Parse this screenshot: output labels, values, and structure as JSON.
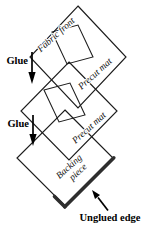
{
  "diagram": {
    "type": "layered-assembly-diagram",
    "background_color": "#ffffff",
    "line_color": "#1c1c1c",
    "thick_edge_color": "#2e2e2e",
    "labels": {
      "fabric_front": "Fabric front",
      "precut_mat_1": "Precut mat",
      "precut_mat_2": "Precut mat",
      "backing_line1": "Backing",
      "backing_line2": "piece",
      "glue_1": "Glue",
      "glue_2": "Glue",
      "unglued_edge": "Unglued edge"
    },
    "layers": [
      {
        "name": "fabric-front-with-precut-mat",
        "shape": "diamond",
        "window": true,
        "labels": [
          "Fabric front",
          "Precut mat"
        ]
      },
      {
        "name": "precut-mat",
        "shape": "diamond",
        "window": true,
        "labels": [
          "Precut mat"
        ]
      },
      {
        "name": "backing-piece",
        "shape": "diamond",
        "window": false,
        "labels": [
          "Backing piece"
        ],
        "thick_edge": "bottom-right"
      }
    ],
    "arrows": [
      {
        "name": "glue-arrow-1",
        "label": "Glue",
        "direction": "down"
      },
      {
        "name": "glue-arrow-2",
        "label": "Glue",
        "direction": "down"
      },
      {
        "name": "unglued-edge-arrow",
        "label": "Unglued edge",
        "direction": "up-left"
      }
    ]
  }
}
